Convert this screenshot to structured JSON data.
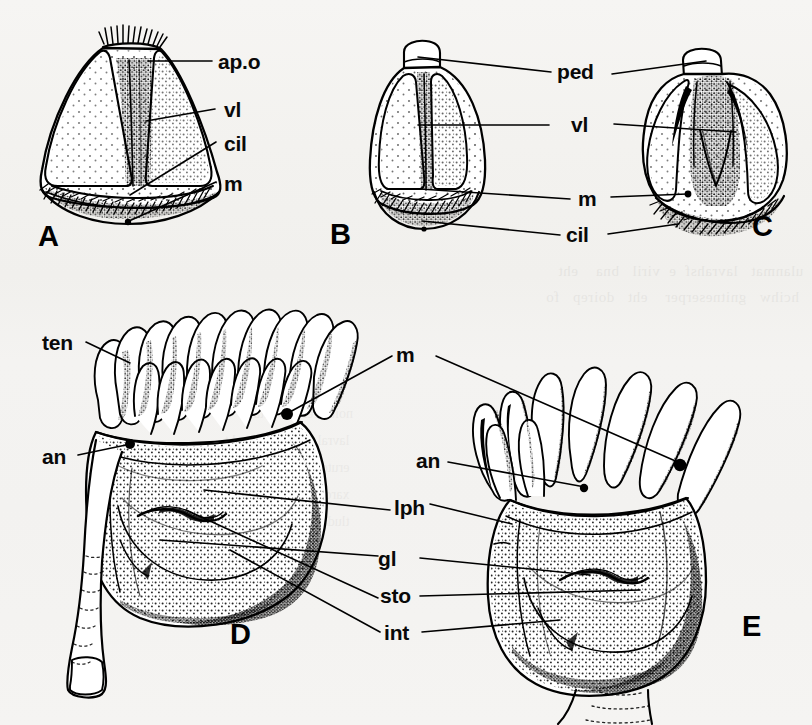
{
  "figure": {
    "kind": "scientific-line-drawing-plate",
    "background_color": "#f4f3f1",
    "ink_color": "#000000",
    "panel_count": 5
  },
  "panels": [
    {
      "id": "A",
      "letter": "A",
      "x": 38,
      "y": 222,
      "caption_labels": [
        "ap.o",
        "vl",
        "cil",
        "m"
      ]
    },
    {
      "id": "B",
      "letter": "B",
      "x": 330,
      "y": 220,
      "caption_labels": [
        "ped",
        "vl",
        "m",
        "cil"
      ]
    },
    {
      "id": "C",
      "letter": "C",
      "x": 752,
      "y": 212,
      "caption_labels": [
        "ped",
        "vl",
        "m",
        "cil"
      ]
    },
    {
      "id": "D",
      "letter": "D",
      "x": 230,
      "y": 620,
      "caption_labels": [
        "ten",
        "an",
        "m",
        "lph",
        "gl",
        "sto",
        "int"
      ]
    },
    {
      "id": "E",
      "letter": "E",
      "x": 742,
      "y": 612,
      "caption_labels": [
        "m",
        "an",
        "lph",
        "gl",
        "sto",
        "int"
      ]
    }
  ],
  "labels": [
    {
      "key": "apo_A",
      "text": "ap.o",
      "x": 218,
      "y": 52,
      "group": "top-left"
    },
    {
      "key": "vl_A",
      "text": "vl",
      "x": 224,
      "y": 100,
      "group": "top-left"
    },
    {
      "key": "cil_A",
      "text": "cil",
      "x": 224,
      "y": 135,
      "group": "top-left"
    },
    {
      "key": "m_A",
      "text": "m",
      "x": 224,
      "y": 177,
      "group": "top-left"
    },
    {
      "key": "ped_BC",
      "text": "ped",
      "x": 557,
      "y": 62,
      "group": "top-mid"
    },
    {
      "key": "vl_BC",
      "text": "vl",
      "x": 571,
      "y": 122,
      "group": "top-mid"
    },
    {
      "key": "m_BC",
      "text": "m",
      "x": 578,
      "y": 190,
      "group": "top-mid"
    },
    {
      "key": "cil_BC",
      "text": "cil",
      "x": 566,
      "y": 226,
      "group": "top-mid"
    },
    {
      "key": "ten_D",
      "text": "ten",
      "x": 42,
      "y": 333,
      "group": "lower-left"
    },
    {
      "key": "an_D",
      "text": "an",
      "x": 42,
      "y": 447,
      "group": "lower-left"
    },
    {
      "key": "m_DE",
      "text": "m",
      "x": 396,
      "y": 345,
      "group": "lower-mid"
    },
    {
      "key": "an_E",
      "text": "an",
      "x": 416,
      "y": 450,
      "group": "lower-mid"
    },
    {
      "key": "lph_DE",
      "text": "lph",
      "x": 396,
      "y": 497,
      "group": "lower-mid"
    },
    {
      "key": "gl_DE",
      "text": "gl",
      "x": 377,
      "y": 551,
      "group": "lower-mid"
    },
    {
      "key": "sto_DE",
      "text": "sto",
      "x": 380,
      "y": 588,
      "group": "lower-mid"
    },
    {
      "key": "int_DE",
      "text": "int",
      "x": 383,
      "y": 625,
      "group": "lower-mid"
    }
  ],
  "abbreviations": {
    "ap.o": "apical organ",
    "vl": "velum",
    "cil": "cilia",
    "m": "mouth",
    "ped": "peduncle",
    "ten": "tentacle",
    "an": "anus",
    "lph": "lophophore",
    "gl": "gland",
    "sto": "stomach",
    "int": "intestine"
  },
  "bleed_through_text": {
    "band1": "  ulanmat   lavrahsf  e  viril   bna    eht\n   hcihw   gnitneserper    eht   doirep   fo",
    "band2": "  noitavresbo   detaler  ot   eht\n   lavral   epyt   dna   eht\n   erutcurts   fo   eht\n   xarohpohpol   ni  eht\n   tluda   msinagro"
  }
}
